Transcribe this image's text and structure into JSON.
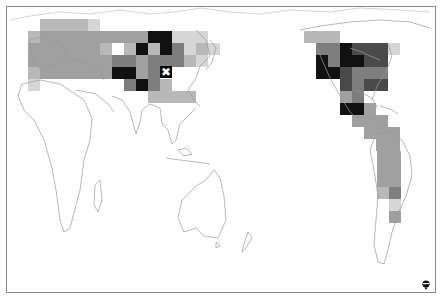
{
  "map": {
    "projection": "pacific-centered world",
    "cell_size": 12,
    "frame": {
      "x": 6,
      "y": 6,
      "w": 430,
      "h": 287,
      "border": "#8a8a8a"
    },
    "shades": {
      "1": "#d6d6d6",
      "2": "#b8b8b8",
      "3": "#a0a0a0",
      "4": "#7e7e7e",
      "5": "#4a4a4a",
      "6": "#111111"
    },
    "cells": [
      [
        40,
        19,
        2
      ],
      [
        52,
        19,
        2
      ],
      [
        64,
        19,
        2
      ],
      [
        76,
        19,
        2
      ],
      [
        88,
        19,
        1
      ],
      [
        28,
        31,
        2
      ],
      [
        40,
        31,
        3
      ],
      [
        52,
        31,
        3
      ],
      [
        64,
        31,
        3
      ],
      [
        76,
        31,
        3
      ],
      [
        88,
        31,
        3
      ],
      [
        100,
        31,
        3
      ],
      [
        112,
        31,
        3
      ],
      [
        124,
        31,
        3
      ],
      [
        136,
        31,
        3
      ],
      [
        148,
        31,
        6
      ],
      [
        160,
        31,
        6
      ],
      [
        172,
        31,
        1
      ],
      [
        184,
        31,
        1
      ],
      [
        196,
        31,
        1
      ],
      [
        28,
        43,
        3
      ],
      [
        40,
        43,
        3
      ],
      [
        52,
        43,
        3
      ],
      [
        64,
        43,
        3
      ],
      [
        76,
        43,
        3
      ],
      [
        88,
        43,
        3
      ],
      [
        100,
        43,
        2
      ],
      [
        124,
        43,
        2
      ],
      [
        136,
        43,
        6
      ],
      [
        148,
        43,
        2
      ],
      [
        160,
        43,
        6
      ],
      [
        172,
        43,
        4
      ],
      [
        184,
        43,
        1
      ],
      [
        196,
        43,
        2
      ],
      [
        208,
        43,
        1
      ],
      [
        28,
        55,
        3
      ],
      [
        40,
        55,
        3
      ],
      [
        52,
        55,
        3
      ],
      [
        64,
        55,
        3
      ],
      [
        76,
        55,
        3
      ],
      [
        88,
        55,
        3
      ],
      [
        100,
        55,
        3
      ],
      [
        112,
        55,
        4
      ],
      [
        124,
        55,
        4
      ],
      [
        136,
        55,
        3
      ],
      [
        148,
        55,
        4
      ],
      [
        160,
        55,
        4
      ],
      [
        172,
        55,
        4
      ],
      [
        184,
        55,
        2
      ],
      [
        196,
        55,
        1
      ],
      [
        28,
        67,
        2
      ],
      [
        40,
        67,
        3
      ],
      [
        52,
        67,
        3
      ],
      [
        64,
        67,
        3
      ],
      [
        76,
        67,
        3
      ],
      [
        88,
        67,
        3
      ],
      [
        100,
        67,
        3
      ],
      [
        112,
        67,
        6
      ],
      [
        124,
        67,
        6
      ],
      [
        136,
        67,
        3
      ],
      [
        148,
        67,
        4
      ],
      [
        28,
        79,
        1
      ],
      [
        124,
        79,
        4
      ],
      [
        136,
        79,
        6
      ],
      [
        148,
        79,
        4
      ],
      [
        160,
        79,
        2
      ],
      [
        148,
        91,
        2
      ],
      [
        160,
        91,
        2
      ],
      [
        172,
        91,
        2
      ],
      [
        184,
        91,
        2
      ],
      [
        304,
        31,
        2
      ],
      [
        316,
        31,
        2
      ],
      [
        328,
        31,
        2
      ],
      [
        316,
        43,
        4
      ],
      [
        328,
        43,
        4
      ],
      [
        340,
        43,
        6
      ],
      [
        352,
        43,
        5
      ],
      [
        364,
        43,
        5
      ],
      [
        376,
        43,
        5
      ],
      [
        388,
        43,
        1
      ],
      [
        316,
        55,
        6
      ],
      [
        328,
        55,
        4
      ],
      [
        340,
        55,
        6
      ],
      [
        352,
        55,
        6
      ],
      [
        364,
        55,
        5
      ],
      [
        376,
        55,
        5
      ],
      [
        316,
        67,
        6
      ],
      [
        328,
        67,
        6
      ],
      [
        340,
        67,
        5
      ],
      [
        352,
        67,
        4
      ],
      [
        364,
        67,
        4
      ],
      [
        376,
        67,
        4
      ],
      [
        340,
        79,
        5
      ],
      [
        352,
        79,
        4
      ],
      [
        364,
        79,
        5
      ],
      [
        376,
        79,
        5
      ],
      [
        340,
        91,
        3
      ],
      [
        352,
        91,
        4
      ],
      [
        340,
        103,
        6
      ],
      [
        352,
        103,
        6
      ],
      [
        364,
        103,
        3
      ],
      [
        352,
        115,
        3
      ],
      [
        364,
        115,
        3
      ],
      [
        376,
        115,
        3
      ],
      [
        364,
        127,
        3
      ],
      [
        376,
        127,
        3
      ],
      [
        388,
        127,
        3
      ],
      [
        376,
        139,
        3
      ],
      [
        388,
        139,
        3
      ],
      [
        377,
        151,
        3
      ],
      [
        389,
        151,
        3
      ],
      [
        377,
        163,
        3
      ],
      [
        389,
        163,
        3
      ],
      [
        377,
        175,
        3
      ],
      [
        389,
        175,
        3
      ],
      [
        377,
        187,
        2
      ],
      [
        389,
        187,
        4
      ],
      [
        389,
        199,
        1
      ],
      [
        389,
        211,
        3
      ]
    ],
    "marker": {
      "x": 160,
      "y": 66,
      "symbol": "✖"
    },
    "logo": {
      "name": "data-provider-logo"
    }
  }
}
